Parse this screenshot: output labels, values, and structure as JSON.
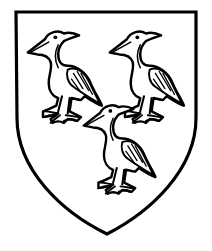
{
  "figure": {
    "type": "heraldic-shield",
    "field_color": "#ffffff",
    "outline_color": "#000000",
    "charges": [
      {
        "name": "heron",
        "position": "dexter-chief"
      },
      {
        "name": "heron",
        "position": "sinister-chief"
      },
      {
        "name": "heron",
        "position": "base"
      }
    ],
    "arrangement": "2 and 1"
  }
}
